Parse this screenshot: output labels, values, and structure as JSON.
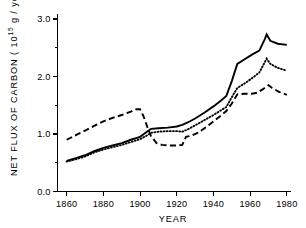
{
  "chart_data": {
    "type": "line",
    "title": "",
    "xlabel": "YEAR",
    "ylabel": "NET FLUX OF CARBON ( 10",
    "ylabel_sup": "15",
    "ylabel_tail": " g / year)",
    "xlim": [
      1855,
      1982
    ],
    "ylim": [
      0.0,
      3.0
    ],
    "grid": false,
    "legend": "none",
    "xticks": [
      1860,
      1880,
      1900,
      1920,
      1940,
      1960,
      1980
    ],
    "xticklabels": [
      "1860",
      "1880",
      "1900",
      "1920",
      "1940",
      "1960",
      "1980"
    ],
    "yticks": [
      0.0,
      1.0,
      2.0,
      3.0
    ],
    "yticklabels": [
      "0.0",
      "1.0",
      "2.0",
      "3.0"
    ],
    "yticks_minor": [
      0.5,
      1.5,
      2.5
    ],
    "series": [
      {
        "name": "solid-curve",
        "style": "solid",
        "color": "#000000",
        "points": [
          [
            1860,
            0.53
          ],
          [
            1865,
            0.58
          ],
          [
            1870,
            0.63
          ],
          [
            1875,
            0.7
          ],
          [
            1880,
            0.76
          ],
          [
            1885,
            0.8
          ],
          [
            1890,
            0.84
          ],
          [
            1895,
            0.9
          ],
          [
            1900,
            0.95
          ],
          [
            1903,
            1.02
          ],
          [
            1906,
            1.09
          ],
          [
            1910,
            1.1
          ],
          [
            1915,
            1.11
          ],
          [
            1920,
            1.13
          ],
          [
            1923,
            1.16
          ],
          [
            1926,
            1.2
          ],
          [
            1930,
            1.27
          ],
          [
            1935,
            1.37
          ],
          [
            1940,
            1.48
          ],
          [
            1944,
            1.58
          ],
          [
            1947,
            1.66
          ],
          [
            1950,
            1.92
          ],
          [
            1953,
            2.22
          ],
          [
            1957,
            2.3
          ],
          [
            1961,
            2.38
          ],
          [
            1965,
            2.45
          ],
          [
            1968,
            2.65
          ],
          [
            1969,
            2.73
          ],
          [
            1971,
            2.62
          ],
          [
            1975,
            2.57
          ],
          [
            1980,
            2.55
          ]
        ]
      },
      {
        "name": "dotted-curve",
        "style": "dotted",
        "color": "#000000",
        "points": [
          [
            1860,
            0.52
          ],
          [
            1865,
            0.56
          ],
          [
            1870,
            0.61
          ],
          [
            1875,
            0.68
          ],
          [
            1880,
            0.73
          ],
          [
            1885,
            0.77
          ],
          [
            1890,
            0.81
          ],
          [
            1895,
            0.86
          ],
          [
            1900,
            0.91
          ],
          [
            1903,
            0.96
          ],
          [
            1906,
            1.02
          ],
          [
            1910,
            1.04
          ],
          [
            1915,
            1.05
          ],
          [
            1920,
            1.05
          ],
          [
            1923,
            1.04
          ],
          [
            1926,
            1.08
          ],
          [
            1930,
            1.15
          ],
          [
            1935,
            1.24
          ],
          [
            1940,
            1.33
          ],
          [
            1944,
            1.41
          ],
          [
            1947,
            1.47
          ],
          [
            1950,
            1.64
          ],
          [
            1953,
            1.8
          ],
          [
            1957,
            1.88
          ],
          [
            1961,
            1.97
          ],
          [
            1965,
            2.07
          ],
          [
            1968,
            2.25
          ],
          [
            1969,
            2.31
          ],
          [
            1971,
            2.22
          ],
          [
            1975,
            2.15
          ],
          [
            1980,
            2.1
          ]
        ]
      },
      {
        "name": "dashed-curve",
        "style": "dashed",
        "color": "#000000",
        "points": [
          [
            1860,
            0.9
          ],
          [
            1865,
            0.98
          ],
          [
            1870,
            1.06
          ],
          [
            1875,
            1.14
          ],
          [
            1880,
            1.22
          ],
          [
            1885,
            1.28
          ],
          [
            1890,
            1.33
          ],
          [
            1895,
            1.39
          ],
          [
            1898,
            1.43
          ],
          [
            1900,
            1.43
          ],
          [
            1902,
            1.3
          ],
          [
            1904,
            1.12
          ],
          [
            1906,
            0.96
          ],
          [
            1909,
            0.84
          ],
          [
            1912,
            0.81
          ],
          [
            1916,
            0.8
          ],
          [
            1920,
            0.8
          ],
          [
            1923,
            0.81
          ],
          [
            1925,
            0.95
          ],
          [
            1928,
            0.97
          ],
          [
            1932,
            1.03
          ],
          [
            1936,
            1.12
          ],
          [
            1940,
            1.22
          ],
          [
            1944,
            1.32
          ],
          [
            1947,
            1.4
          ],
          [
            1950,
            1.53
          ],
          [
            1953,
            1.69
          ],
          [
            1957,
            1.7
          ],
          [
            1961,
            1.7
          ],
          [
            1964,
            1.72
          ],
          [
            1967,
            1.78
          ],
          [
            1970,
            1.85
          ],
          [
            1972,
            1.8
          ],
          [
            1976,
            1.73
          ],
          [
            1980,
            1.68
          ]
        ]
      }
    ]
  }
}
